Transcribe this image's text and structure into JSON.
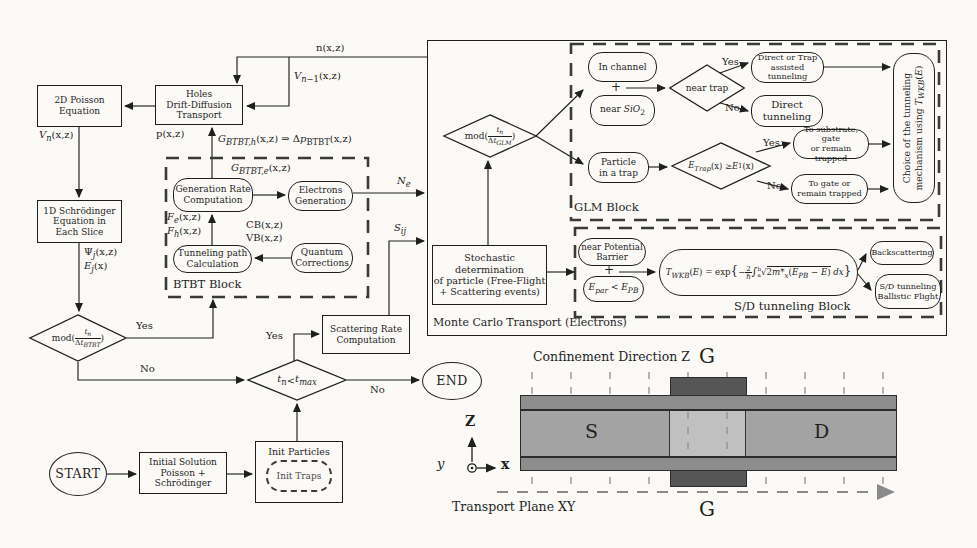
{
  "nodes": {
    "start": "START",
    "end": "END",
    "poisson": "2D Poisson<br>Equation",
    "holes": "Holes<br>Drift-Diffusion<br>Transport",
    "schrodinger": "1D Schrödinger<br>Equation in<br>Each Slice",
    "generation_rate": "Generation Rate<br>Computation",
    "electrons_generation": "Electrons<br>Generation",
    "tunneling_path": "Tunneling path<br>Calculation",
    "quantum_corrections": "Quantum<br>Corrections",
    "scattering_rate": "Scattering Rate<br>Computation",
    "stochastic": "Stochastic<br>determination<br>of particle (Free-Flight<br>+ Scattering events)",
    "initial_solution": "Initial Solution<br>Poisson +<br>Schrödinger",
    "init_particles": "Init Particles",
    "init_traps": "Init Traps"
  },
  "decisions": {
    "mod_btbt": "mod(<span class='fr'><span class='nu'><i>t<sub>n</sub></i></span><span>Δ<i>t<sub>BTBT</sub></i></span></span>)",
    "mod_glm": "mod(<span class='fr'><span class='nu'><i>t<sub>n</sub></i></span><span>Δ<i>t<sub>GLM</sub></i></span></span>)",
    "tmax": "<i>t<sub>n</sub></i> &lt; <i>t<sub>max</sub></i>",
    "near_trap": "near trap",
    "etrap": "<i>E<sub>Trap</sub></i>(x) ≥ <i>E</i><sub>1</sub>(x)",
    "yes": "Yes",
    "no": "No"
  },
  "signals": {
    "n": "n(x,z)",
    "v_prev": "<i>V</i><sub><i>n</i>−1</sub>(x,z)",
    "v_n": "<i>V<sub>n</sub></i>(x,z)",
    "p": "p(x,z)",
    "g_h": "<i>G<sub>BTBT,h</sub></i>(x,z) ⇒ Δ<i>p</i><sub>BTBT</sub>(x,z)",
    "g_e": "<i>G<sub>BTBT,e</sub></i>(x,z)",
    "f_eh": "<i>F<sub>e</sub></i>(x,z)<br><i>F<sub>h</sub></i>(x,z)",
    "cb_vb": "CB(x,z)<br>VB(x,z)",
    "psi_e": "Ψ<i><sub>j</sub></i>(x,z)<br><i>E<sub>j</sub></i>(x)",
    "n_e": "<i>N<sub>e</sub></i>",
    "s_ij": "<i>S<sub>ij</sub></i>"
  },
  "mc": {
    "title": "Monte Carlo Transport (Electrons)",
    "btbt_title": "BTBT Block",
    "glm_title": "GLM Block",
    "sd_title": "S/D tunneling Block",
    "in_channel": "In channel",
    "near_sio2": "near <i>SiO</i><sub>2</sub>",
    "plus": "+",
    "particle_trap": "Particle<br>in a trap",
    "direct_trap": "Direct or Trap<br>assisted tunneling",
    "direct": "Direct<br>tunneling",
    "to_substrate": "To substrate, gate<br>or remain trapped",
    "to_gate": "To gate or<br>remain trapped",
    "choice": "Choice of the tunneling<br>mechanism using <i>T<sub>WKB</sub></i>(<i>E</i>)",
    "near_barrier": "near Potential<br>Barrier",
    "epar": "<i>E<sub>par</sub></i> &lt; <i>E<sub>PB</sub></i>",
    "formula": "<i>T<sub>WKB</sub></i>(<i>E</i>) = exp<span style='font-size:1.4em'>{</span>−<span class='fr'><span class='nu'>2</span><span>ℏ</span></span><span style='font-size:1.25em'>∫</span><span class='fr'><span style='font-size:.8em'>b</span><span style='font-size:.8em'>a</span></span>√<span class='ov'>2<i>m*<sub>x</sub></i>(<i>E<sub>PB</sub></i> − <i>E</i>)</span> <i>dx</i><span style='font-size:1.4em'>}</span>",
    "backscattering": "Backscattering",
    "ballistic": "S/D tunneling<br>Ballistic Flight"
  },
  "device": {
    "confinement": "Confinement Direction Z",
    "transport": "Transport Plane XY",
    "gate_top": "G",
    "gate_bottom": "G",
    "source": "S",
    "drain": "D",
    "ax_z": "Z",
    "ax_x": "x",
    "ax_y": "y",
    "colors": {
      "gate": "#565656",
      "oxide_strip": "#8d8d8d",
      "body": "#a3a3a3",
      "channel": "#c0c0c0"
    }
  }
}
